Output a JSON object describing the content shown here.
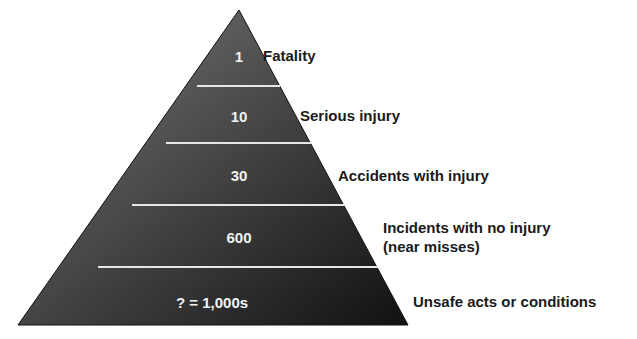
{
  "diagram": {
    "type": "pyramid",
    "colors": {
      "fill_top": "#6a6a6a",
      "fill_bottom": "#1c1c1c",
      "separator": "#e6e6e6",
      "text_inside": "#f2f2f2",
      "label_text": "#1a1a1a"
    },
    "tiers": [
      {
        "value": "1",
        "label_line1": "Fatality",
        "label_line2": ""
      },
      {
        "value": "10",
        "label_line1": "Serious injury",
        "label_line2": ""
      },
      {
        "value": "30",
        "label_line1": "Accidents with injury",
        "label_line2": ""
      },
      {
        "value": "600",
        "label_line1": "Incidents with no injury",
        "label_line2": "(near misses)"
      },
      {
        "value": "? = 1,000s",
        "label_line1": "Unsafe acts or conditions",
        "label_line2": ""
      }
    ]
  }
}
